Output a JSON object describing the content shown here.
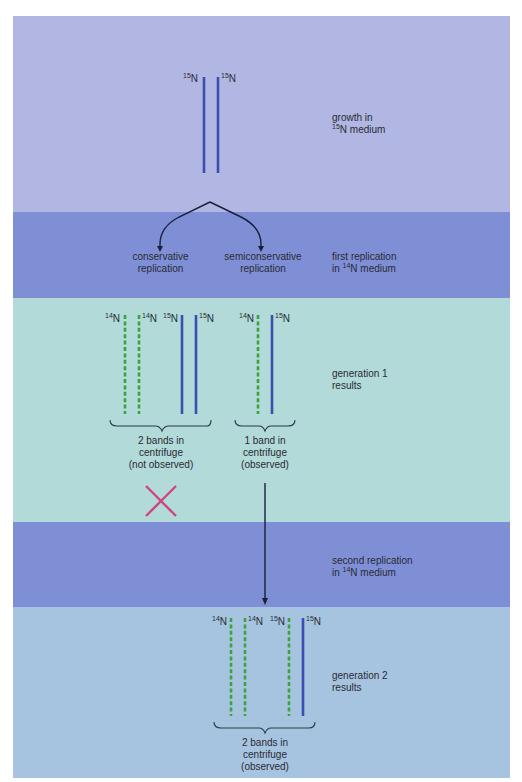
{
  "diagram": {
    "colors": {
      "band_light_lavender": "#b1b7e2",
      "band_periwinkle": "#7f8fd6",
      "band_mint": "#b1dad8",
      "band_sky": "#a6c4df",
      "strand_15N": "#3a4fb0",
      "strand_14N": "#3aa33a",
      "arrow": "#1a1f3a",
      "cross": "#d0457a"
    },
    "stages": [
      {
        "id": "growth",
        "label_line1": "growth in",
        "label_sup": "15",
        "label_line2": "N medium"
      },
      {
        "id": "first_replication",
        "label_line1": "first replication",
        "label_prefix": "in ",
        "label_sup": "14",
        "label_line2": "N medium"
      },
      {
        "id": "generation1",
        "label_line1": "generation 1",
        "label_line2": "results"
      },
      {
        "id": "second_replication",
        "label_line1": "second replication",
        "label_prefix": "in ",
        "label_sup": "14",
        "label_line2": "N medium"
      },
      {
        "id": "generation2",
        "label_line1": "generation 2",
        "label_line2": "results"
      }
    ],
    "branches": {
      "conservative": {
        "line1": "conservative",
        "line2": "replication"
      },
      "semiconservative": {
        "line1": "semiconservative",
        "line2": "replication"
      }
    },
    "isotopes": {
      "n15_sup": "15",
      "n14_sup": "14",
      "symbol": "N"
    },
    "parent_strands": [
      "15N",
      "15N"
    ],
    "gen1_conservative_strands": [
      "14N",
      "14N",
      "15N",
      "15N"
    ],
    "gen1_semiconservative_strands": [
      "14N",
      "15N"
    ],
    "gen2_strands": [
      "14N",
      "14N",
      "15N",
      "15N"
    ],
    "results": {
      "gen1_conservative": {
        "line1": "2 bands in",
        "line2": "centrifuge",
        "line3": "(not observed)"
      },
      "gen1_semiconservative": {
        "line1": "1 band in",
        "line2": "centrifuge",
        "line3": "(observed)"
      },
      "gen2": {
        "line1": "2 bands in",
        "line2": "centrifuge",
        "line3": "(observed)"
      }
    },
    "rejected_marker": "X"
  }
}
